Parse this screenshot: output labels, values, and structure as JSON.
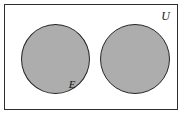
{
  "figure": {
    "type": "venn-diagram",
    "universe": {
      "label": "U",
      "fill_color": "#ffffff",
      "border_color": "#2e2e2e"
    },
    "sets": [
      {
        "label": "E",
        "fill_color": "#adadad",
        "border_color": "#262626",
        "shaded": true
      },
      {
        "label": "F",
        "fill_color": "#adadad",
        "border_color": "#262626",
        "shaded": true
      }
    ]
  }
}
